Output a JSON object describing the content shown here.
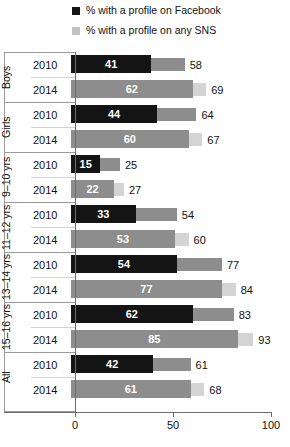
{
  "legend": [
    {
      "label": "% with a profile on Facebook",
      "swatch": "#141414",
      "name": "legend-facebook"
    },
    {
      "label": "% with a profile on any SNS",
      "swatch": "#c2c2c2",
      "name": "legend-sns"
    }
  ],
  "axis": {
    "ticks": [
      "0",
      "50",
      "100"
    ],
    "min": 0,
    "max": 100
  },
  "colors": {
    "facebook_2010": "#141414",
    "facebook_2014": "#8d8d8d",
    "sns_2010": "#8d8d8d",
    "sns_2014": "#d4d4d4",
    "axis": "#6d6d6d",
    "box": "#9a9a9a"
  },
  "chart_data": {
    "type": "bar",
    "orientation": "horizontal",
    "title": "",
    "xlabel": "",
    "ylabel": "",
    "xlim": [
      0,
      100
    ],
    "xticks": [
      0,
      50,
      100
    ],
    "grid": false,
    "legend_position": "top",
    "series": [
      {
        "name": "% with a profile on Facebook",
        "values": [
          41,
          62,
          44,
          60,
          15,
          22,
          33,
          53,
          54,
          77,
          62,
          85,
          42,
          61
        ]
      },
      {
        "name": "% with a profile on any SNS",
        "values": [
          58,
          69,
          64,
          67,
          25,
          27,
          54,
          60,
          77,
          84,
          83,
          93,
          61,
          68
        ]
      }
    ],
    "categories": [
      "Boys 2010",
      "Boys 2014",
      "Girls 2010",
      "Girls 2014",
      "9–10 yrs 2010",
      "9–10 yrs 2014",
      "11–12 yrs 2010",
      "11–12 yrs 2014",
      "13–14 yrs 2010",
      "13–14 yrs 2014",
      "15–16 yrs 2010",
      "15–16 yrs 2014",
      "All 2010",
      "All 2014"
    ],
    "groups": [
      {
        "label": "Boys",
        "rows": [
          {
            "year": "2010",
            "facebook": 41,
            "sns": 58
          },
          {
            "year": "2014",
            "facebook": 62,
            "sns": 69
          }
        ]
      },
      {
        "label": "Girls",
        "rows": [
          {
            "year": "2010",
            "facebook": 44,
            "sns": 64
          },
          {
            "year": "2014",
            "facebook": 60,
            "sns": 67
          }
        ]
      },
      {
        "label": "9–10 yrs",
        "rows": [
          {
            "year": "2010",
            "facebook": 15,
            "sns": 25
          },
          {
            "year": "2014",
            "facebook": 22,
            "sns": 27
          }
        ]
      },
      {
        "label": "11–12 yrs",
        "rows": [
          {
            "year": "2010",
            "facebook": 33,
            "sns": 54
          },
          {
            "year": "2014",
            "facebook": 53,
            "sns": 60
          }
        ]
      },
      {
        "label": "13–14 yrs",
        "rows": [
          {
            "year": "2010",
            "facebook": 54,
            "sns": 77
          },
          {
            "year": "2014",
            "facebook": 77,
            "sns": 84
          }
        ]
      },
      {
        "label": "15–16 yrs",
        "rows": [
          {
            "year": "2010",
            "facebook": 62,
            "sns": 83
          },
          {
            "year": "2014",
            "facebook": 85,
            "sns": 93
          }
        ]
      },
      {
        "label": "All",
        "rows": [
          {
            "year": "2010",
            "facebook": 42,
            "sns": 61
          },
          {
            "year": "2014",
            "facebook": 61,
            "sns": 68
          }
        ]
      }
    ]
  }
}
